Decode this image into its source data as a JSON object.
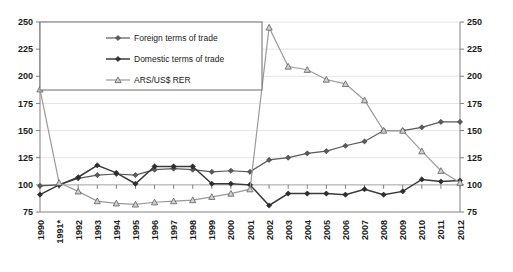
{
  "chart_data": {
    "type": "line",
    "title": "",
    "xlabel": "",
    "ylabel": "",
    "ylim": [
      75,
      250
    ],
    "yticks": [
      75,
      100,
      125,
      150,
      175,
      200,
      225,
      250
    ],
    "grid": true,
    "legend_position": "top-left",
    "dual_axis": true,
    "right_axis_same_as_left": true,
    "categories": [
      "1990",
      "1991*",
      "1992",
      "1993",
      "1994",
      "1995",
      "1996",
      "1997",
      "1998",
      "1999",
      "2000",
      "2001",
      "2002",
      "2003",
      "2004",
      "2005",
      "2006",
      "2007",
      "2008",
      "2009",
      "2010",
      "2011",
      "2012"
    ],
    "series": [
      {
        "name": "Foreign terms of trade",
        "marker": "diamond",
        "values": [
          99,
          100,
          106,
          109,
          110,
          109,
          114,
          115,
          114,
          112,
          113,
          112,
          123,
          125,
          129,
          131,
          136,
          140,
          150,
          150,
          153,
          158,
          158
        ]
      },
      {
        "name": "Domestic terms of trade",
        "marker": "diamond-filled",
        "values": [
          91,
          100,
          107,
          118,
          111,
          101,
          117,
          117,
          117,
          101,
          101,
          100,
          81,
          92,
          92,
          92,
          91,
          96,
          91,
          94,
          105,
          103,
          104
        ]
      },
      {
        "name": "ARS/US$ RER",
        "marker": "triangle",
        "values": [
          188,
          102,
          94,
          85,
          83,
          82,
          84,
          85,
          86,
          89,
          92,
          96,
          245,
          209,
          206,
          197,
          193,
          178,
          150,
          150,
          131,
          113,
          102
        ]
      }
    ]
  },
  "legend": {
    "items": [
      {
        "label": "Foreign terms of trade",
        "marker": "diamond",
        "color": "#5a5a5a"
      },
      {
        "label": "Domestic terms of trade",
        "marker": "diamond-filled",
        "color": "#2e2e2e"
      },
      {
        "label": "ARS/US$ RER",
        "marker": "triangle",
        "color": "#9a9a9a"
      }
    ]
  }
}
